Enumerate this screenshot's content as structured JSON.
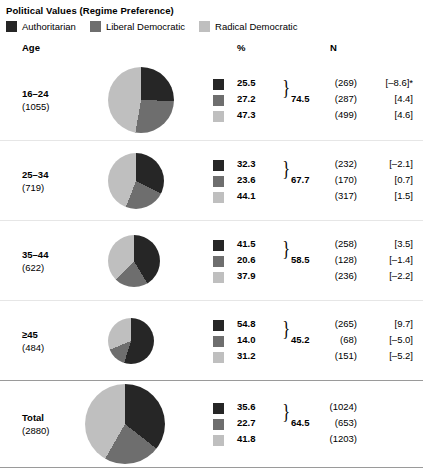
{
  "title": "Political Values (Regime Preference)",
  "colors": {
    "authoritarian": "#262626",
    "liberal_democratic": "#6e6e6e",
    "radical_democratic": "#bfbfbf"
  },
  "legend": [
    {
      "label": "Authoritarian",
      "color": "#262626"
    },
    {
      "label": "Liberal Democratic",
      "color": "#6e6e6e"
    },
    {
      "label": "Radical Democratic",
      "color": "#bfbfbf"
    }
  ],
  "columns": {
    "group": "Age",
    "percent": "%",
    "n": "N"
  },
  "rows": [
    {
      "name": "16–24",
      "n_label": "(1055)",
      "brace_value": "74.5",
      "pie_size": 66,
      "series": [
        {
          "pct": "25.5",
          "n": "(269)",
          "diff": "[–8.6]*"
        },
        {
          "pct": "27.2",
          "n": "(287)",
          "diff": "[4.4]"
        },
        {
          "pct": "47.3",
          "n": "(499)",
          "diff": "[4.6]"
        }
      ]
    },
    {
      "name": "25–34",
      "n_label": "(719)",
      "brace_value": "67.7",
      "pie_size": 56,
      "series": [
        {
          "pct": "32.3",
          "n": "(232)",
          "diff": "[–2.1]"
        },
        {
          "pct": "23.6",
          "n": "(170)",
          "diff": "[0.7]"
        },
        {
          "pct": "44.1",
          "n": "(317)",
          "diff": "[1.5]"
        }
      ]
    },
    {
      "name": "35–44",
      "n_label": "(622)",
      "brace_value": "58.5",
      "pie_size": 52,
      "series": [
        {
          "pct": "41.5",
          "n": "(258)",
          "diff": "[3.5]"
        },
        {
          "pct": "20.6",
          "n": "(128)",
          "diff": "[–1.4]"
        },
        {
          "pct": "37.9",
          "n": "(236)",
          "diff": "[–2.2]"
        }
      ]
    },
    {
      "name": "≥45",
      "n_label": "(484)",
      "brace_value": "45.2",
      "pie_size": 46,
      "series": [
        {
          "pct": "54.8",
          "n": "(265)",
          "diff": "[9.7]"
        },
        {
          "pct": "14.0",
          "n": "(68)",
          "diff": "[–5.0]"
        },
        {
          "pct": "31.2",
          "n": "(151)",
          "diff": "[–5.2]"
        }
      ]
    },
    {
      "name": "Total",
      "n_label": "(2880)",
      "brace_value": "64.5",
      "pie_size": 80,
      "series": [
        {
          "pct": "35.6",
          "n": "(1024)",
          "diff": ""
        },
        {
          "pct": "22.7",
          "n": "(653)",
          "diff": ""
        },
        {
          "pct": "41.8",
          "n": "(1203)",
          "diff": ""
        }
      ]
    }
  ],
  "chart_data": {
    "type": "pie",
    "title": "Political Values (Regime Preference)",
    "legend_position": "top",
    "categories": [
      "Authoritarian",
      "Liberal Democratic",
      "Radical Democratic"
    ],
    "colors": [
      "#262626",
      "#6e6e6e",
      "#bfbfbf"
    ],
    "groups": [
      {
        "name": "16–24",
        "total_n": 1055,
        "values": [
          25.5,
          27.2,
          47.3
        ],
        "counts": [
          269,
          287,
          499
        ],
        "residuals": [
          -8.6,
          4.4,
          4.6
        ],
        "significance": [
          "*",
          "",
          ""
        ],
        "democratic_sum": 74.5
      },
      {
        "name": "25–34",
        "total_n": 719,
        "values": [
          32.3,
          23.6,
          44.1
        ],
        "counts": [
          232,
          170,
          317
        ],
        "residuals": [
          -2.1,
          0.7,
          1.5
        ],
        "significance": [
          "",
          "",
          ""
        ],
        "democratic_sum": 67.7
      },
      {
        "name": "35–44",
        "total_n": 622,
        "values": [
          41.5,
          20.6,
          37.9
        ],
        "counts": [
          258,
          128,
          236
        ],
        "residuals": [
          3.5,
          -1.4,
          -2.2
        ],
        "significance": [
          "",
          "",
          ""
        ],
        "democratic_sum": 58.5
      },
      {
        "name": "≥45",
        "total_n": 484,
        "values": [
          54.8,
          14.0,
          31.2
        ],
        "counts": [
          265,
          68,
          151
        ],
        "residuals": [
          9.7,
          -5.0,
          -5.2
        ],
        "significance": [
          "",
          "",
          ""
        ],
        "democratic_sum": 45.2
      },
      {
        "name": "Total",
        "total_n": 2880,
        "values": [
          35.6,
          22.7,
          41.8
        ],
        "counts": [
          1024,
          653,
          1203
        ],
        "residuals": [],
        "significance": [],
        "democratic_sum": 64.5
      }
    ]
  }
}
